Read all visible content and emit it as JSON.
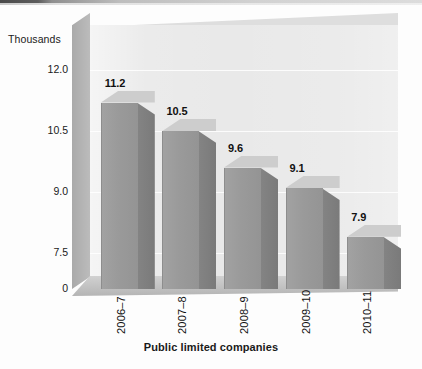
{
  "chart_data": {
    "type": "bar",
    "title": "",
    "subtitle": "",
    "xlabel": "Public limited companies",
    "ylabel": "Thousands",
    "units_note": "Thousands",
    "categories": [
      "2006–7",
      "2007–8",
      "2008–9",
      "2009–10",
      "2010–11"
    ],
    "values": [
      11.2,
      10.5,
      9.6,
      9.1,
      7.9
    ],
    "value_labels": [
      "11.2",
      "10.5",
      "9.6",
      "9.1",
      "7.9"
    ],
    "ytick_labels": [
      "12.0",
      "10.5",
      "9.0",
      "7.5",
      "0"
    ],
    "ytick_values": [
      12.0,
      10.5,
      9.0,
      7.5,
      0
    ],
    "ylim": [
      7.0,
      12.6
    ],
    "axis_break": true,
    "grid": true,
    "legend": "none",
    "style": "3d-column",
    "colors": {
      "bar_front": "#9a9a9a",
      "bar_side": "#7e7e7e",
      "bar_top": "#cdcdcd",
      "plot_wall": "#e9e9e9",
      "side_wall": "#b4b4b4",
      "floor": "#c2c2c2",
      "gridline": "#ffffff",
      "text": "#111111",
      "page_background": "#fdfdfd"
    }
  }
}
